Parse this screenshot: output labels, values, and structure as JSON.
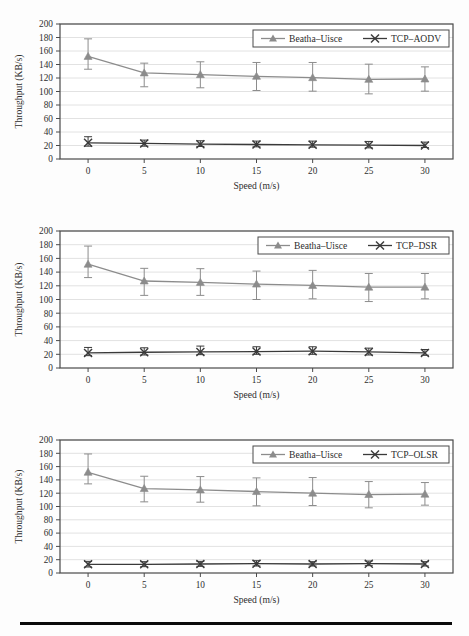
{
  "figure": {
    "background_color": "#fdfdfd",
    "rule_color": "#0a0a0a",
    "panel_count": 3
  },
  "axis": {
    "xlabel": "Speed (m/s)",
    "ylabel": "Throughput (KB/s)",
    "xticks": [
      "0",
      "5",
      "10",
      "15",
      "20",
      "25",
      "30"
    ],
    "yticks": [
      "0",
      "20",
      "40",
      "60",
      "80",
      "100",
      "120",
      "140",
      "160",
      "180",
      "200"
    ]
  },
  "colors": {
    "series_beatha": "#8c8c8c",
    "series_tcp": "#3a3a3a",
    "grid": "#e2e2e2",
    "frame": "#4a4a4a",
    "text": "#2e2e2e"
  },
  "legend": {
    "marker_beatha": "triangle-marker",
    "marker_tcp": "x-marker",
    "beatha_label": "Beatha–Uisce"
  },
  "chart_data": [
    {
      "type": "line",
      "title": "",
      "xlabel": "Speed (m/s)",
      "ylabel": "Throughput (KB/s)",
      "xlim": [
        -2.5,
        32.5
      ],
      "ylim": [
        0,
        200
      ],
      "ytick_step": 20,
      "grid": true,
      "legend_position": "top-right",
      "x": [
        0,
        5,
        10,
        15,
        20,
        25,
        30
      ],
      "series": [
        {
          "name": "Beatha–Uisce",
          "marker": "triangle",
          "color": "#8c8c8c",
          "values": [
            152,
            127.5,
            125,
            122.5,
            120.5,
            118,
            118.5
          ],
          "err_low": [
            133,
            107,
            105.5,
            101.5,
            100.5,
            96.5,
            100.5
          ],
          "err_high": [
            178,
            142,
            144,
            143,
            143,
            140.5,
            136.5
          ]
        },
        {
          "name": "TCP–AODV",
          "marker": "x",
          "color": "#3a3a3a",
          "values": [
            24,
            23,
            22,
            21.5,
            21,
            20.5,
            20
          ],
          "err_low": [
            19,
            19,
            18.5,
            18,
            17.5,
            16.5,
            17
          ],
          "err_high": [
            33,
            28,
            27,
            26.5,
            26.5,
            26,
            25
          ]
        }
      ]
    },
    {
      "type": "line",
      "title": "",
      "xlabel": "Speed (m/s)",
      "ylabel": "Throughput (KB/s)",
      "xlim": [
        -2.5,
        32.5
      ],
      "ylim": [
        0,
        200
      ],
      "ytick_step": 20,
      "grid": true,
      "legend_position": "top-right",
      "x": [
        0,
        5,
        10,
        15,
        20,
        25,
        30
      ],
      "series": [
        {
          "name": "Beatha–Uisce",
          "marker": "triangle",
          "color": "#8c8c8c",
          "values": [
            151.5,
            127,
            125,
            122.5,
            120.5,
            118,
            118
          ],
          "err_low": [
            132,
            106,
            106,
            100,
            101,
            97,
            101
          ],
          "err_high": [
            178,
            145.5,
            145,
            141.5,
            142.5,
            138,
            138
          ]
        },
        {
          "name": "TCP–DSR",
          "marker": "x",
          "color": "#3a3a3a",
          "values": [
            22,
            23,
            23.5,
            24,
            24.5,
            23.5,
            22
          ],
          "err_low": [
            18,
            19,
            19.5,
            20,
            20,
            19,
            18.5
          ],
          "err_high": [
            30,
            29.5,
            32,
            31,
            31,
            29,
            27
          ]
        }
      ]
    },
    {
      "type": "line",
      "title": "",
      "xlabel": "Speed (m/s)",
      "ylabel": "Throughput (KB/s)",
      "xlim": [
        -2.5,
        32.5
      ],
      "ylim": [
        0,
        200
      ],
      "ytick_step": 20,
      "grid": true,
      "legend_position": "top-right",
      "x": [
        0,
        5,
        10,
        15,
        20,
        25,
        30
      ],
      "series": [
        {
          "name": "Beatha–Uisce",
          "marker": "triangle",
          "color": "#8c8c8c",
          "values": [
            151.5,
            127,
            125,
            122.5,
            120,
            118,
            118.5
          ],
          "err_low": [
            134,
            107,
            106.5,
            101,
            101.5,
            98,
            102
          ],
          "err_high": [
            179,
            145.5,
            145,
            143,
            143.5,
            137.5,
            136
          ]
        },
        {
          "name": "TCP–OLSR",
          "marker": "x",
          "color": "#3a3a3a",
          "values": [
            13,
            13,
            13.5,
            14,
            13.5,
            14,
            13.5
          ],
          "err_low": [
            9,
            9.5,
            10,
            10.5,
            10.5,
            11,
            10.5
          ],
          "err_high": [
            17.5,
            17,
            17.5,
            18.5,
            17,
            18,
            17
          ]
        }
      ]
    }
  ]
}
